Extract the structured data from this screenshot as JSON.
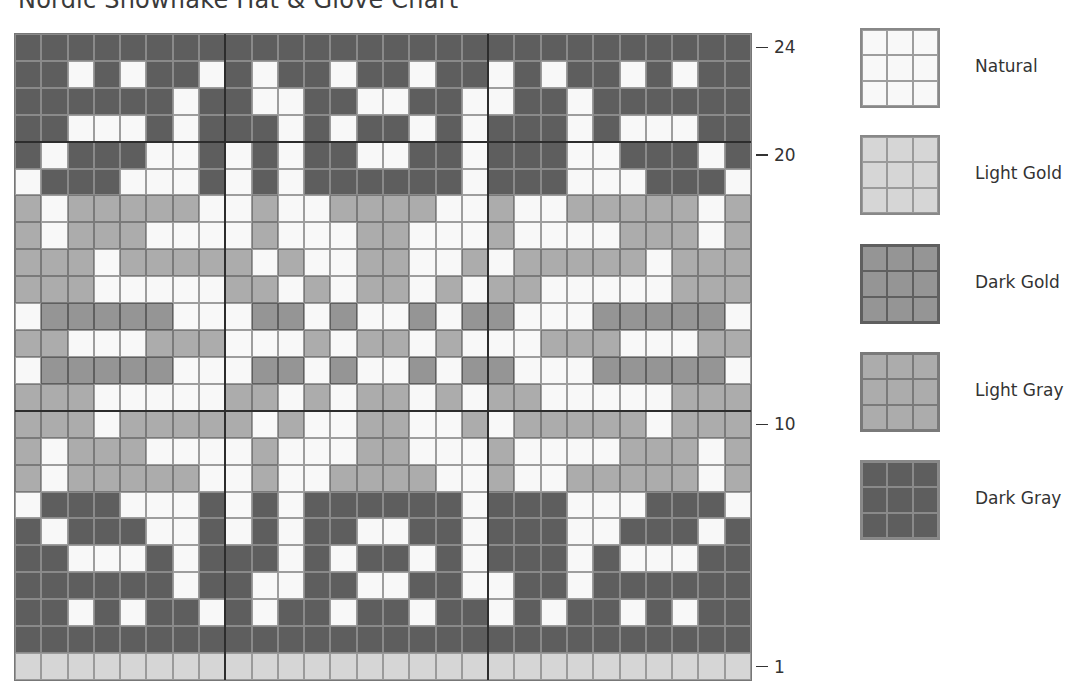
{
  "title": "Nordic Snowflake Hat & Glove Chart",
  "colors": {
    "N": "#f8f8f8",
    "Y": "#d6d6d6",
    "G": "#959595",
    "L": "#acacac",
    "D": "#5e5e5e"
  },
  "legend": [
    {
      "code": "N",
      "label": "Natural"
    },
    {
      "code": "Y",
      "label": "Light Gold"
    },
    {
      "code": "G",
      "label": "Dark Gold"
    },
    {
      "code": "L",
      "label": "Light Gray"
    },
    {
      "code": "D",
      "label": "Dark Gray"
    }
  ],
  "row_labels": [
    {
      "row": 24,
      "label": "24"
    },
    {
      "row": 20,
      "label": "20"
    },
    {
      "row": 10,
      "label": "10"
    },
    {
      "row": 1,
      "label": "1"
    }
  ],
  "grid": {
    "columns": 28,
    "rows": 24,
    "heavy_vertical_after_cols": [
      8,
      18
    ],
    "heavy_horizontal_below_rows": [
      21,
      11
    ],
    "pattern_top_to_bottom": [
      {
        "row": 24,
        "cells": "DDDDDDDDDDDDDDDDDDDDDDDDDDDD"
      },
      {
        "row": 23,
        "cells": "DDNDNDDNDNDDNDDNDDNDNDDNDNDD"
      },
      {
        "row": 22,
        "cells": "DDDDDDNDDNNDDNNDDNNDDNDDDDDD"
      },
      {
        "row": 21,
        "cells": "DDNNNDNDDDNDNDDNDNDDDNDNNNDD"
      },
      {
        "row": 20,
        "cells": "DNDDDNNDNDNDDNNDDNDDDNNDDDND"
      },
      {
        "row": 19,
        "cells": "NDDDNNNDNDNDDDDDDNDDDNNNDDDN"
      },
      {
        "row": 18,
        "cells": "LNLLLLLNNLNNLLLLNNLNNLLLLLNL"
      },
      {
        "row": 17,
        "cells": "LNLLLNNNNLNNNLLNNNLNNNNLLLNL"
      },
      {
        "row": 16,
        "cells": "LLLNLLLLLNLNNLLNNLNLLLLLNLLL"
      },
      {
        "row": 15,
        "cells": "LLLNNNNNLLNLNLLNLNLLNNNNNLLL"
      },
      {
        "row": 14,
        "cells": "NGGGGGNNNGGNGNNGNGGNNNGGGGGN"
      },
      {
        "row": 13,
        "cells": "LLNNNLLLNNNLNLLNLNNNLLLNNNLL"
      },
      {
        "row": 12,
        "cells": "NGGGGGNNNGGNGNNGNGGNNNGGGGGN"
      },
      {
        "row": 11,
        "cells": "LLLNNNNNLLNLNLLNLNLLNNNNNLLL"
      },
      {
        "row": 10,
        "cells": "LLLNLLLLLNLNNLLNNLNLLLLLNLLL"
      },
      {
        "row": 9,
        "cells": "LNLLLNNNNLNNNLLNNNLNNNNLLLNL"
      },
      {
        "row": 8,
        "cells": "LNLLLLLNNLNNLLLLNNLNNLLLLLNL"
      },
      {
        "row": 7,
        "cells": "NDDDNNNDNDNDDDDDDNDDDNNNDDDN"
      },
      {
        "row": 6,
        "cells": "DNDDDNNDNDNDDNNDDNDDDNNDDDND"
      },
      {
        "row": 5,
        "cells": "DDNNNDNDDDNDNDDNDNDDDNDNNNDD"
      },
      {
        "row": 4,
        "cells": "DDDDDDNDDNNDDNNDDNNDDNDDDDDD"
      },
      {
        "row": 3,
        "cells": "DDNDNDDNDNDDNDDNDDNDNDDNDNDD"
      },
      {
        "row": 2,
        "cells": "DDDDDDDDDDDDDDDDDDDDDDDDDDDD"
      },
      {
        "row": 1,
        "cells": "YYYYYYYYYYYYYYYYYYYYYYYYYYYY"
      }
    ]
  }
}
